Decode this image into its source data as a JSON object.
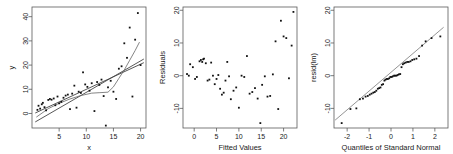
{
  "figure": {
    "panel_count": 3,
    "background": "#ffffff",
    "point_color": "#111111",
    "axis_color": "#5a5a5a"
  },
  "chart_data": [
    {
      "type": "scatter",
      "title": "",
      "xlabel": "x",
      "ylabel": "y",
      "xlim": [
        0,
        21
      ],
      "ylim": [
        -6,
        44
      ],
      "xticks": [
        5,
        10,
        15,
        20
      ],
      "yticks": [
        0,
        10,
        20,
        30,
        40
      ],
      "grid": false,
      "legend": "none",
      "x": [
        1.0,
        1.2,
        1.5,
        1.8,
        2.0,
        2.3,
        2.6,
        3.0,
        3.3,
        3.6,
        4.0,
        4.3,
        4.7,
        5.0,
        5.4,
        5.8,
        6.2,
        6.6,
        7.0,
        7.4,
        7.8,
        8.2,
        8.6,
        9.0,
        9.4,
        9.8,
        10.2,
        10.6,
        11.0,
        11.5,
        12.0,
        12.4,
        12.8,
        13.2,
        13.6,
        14.0,
        14.5,
        15.0,
        15.5,
        16.0,
        16.5,
        17.0,
        17.5,
        18.0,
        18.5,
        19.0,
        19.5,
        20.0
      ],
      "y": [
        1.5,
        3.2,
        2.0,
        3.8,
        4.4,
        2.6,
        1.3,
        5.6,
        6.0,
        5.7,
        6.2,
        3.4,
        7.0,
        4.2,
        4.8,
        6.5,
        7.4,
        7.8,
        1.8,
        8.2,
        11.5,
        2.4,
        9.0,
        8.5,
        17.0,
        12.0,
        11.0,
        9.4,
        12.5,
        1.0,
        13.0,
        11.8,
        14.0,
        7.2,
        -5.0,
        10.8,
        13.5,
        9.0,
        6.0,
        18.5,
        19.5,
        29.0,
        23.0,
        35.5,
        7.0,
        30.5,
        41.5,
        20.0
      ],
      "lines": [
        {
          "name": "least-squares-fit",
          "type": "straight",
          "x0": 0.6,
          "y0": 0.2,
          "x1": 20.6,
          "y1": 21.0
        },
        {
          "name": "robust-fit",
          "type": "straight",
          "x0": 0.6,
          "y0": -3.5,
          "x1": 20.6,
          "y1": 22.5
        },
        {
          "name": "lowess-smooth",
          "type": "curve",
          "points": [
            [
              0.8,
              -1.5
            ],
            [
              3,
              2.0
            ],
            [
              5,
              4.2
            ],
            [
              7,
              6.0
            ],
            [
              9,
              7.4
            ],
            [
              11,
              8.4
            ],
            [
              12.5,
              8.6
            ],
            [
              14,
              8.8
            ],
            [
              15,
              11.0
            ],
            [
              16,
              14.5
            ],
            [
              17,
              18.0
            ],
            [
              18,
              22.0
            ],
            [
              19,
              26.0
            ],
            [
              19.8,
              29.5
            ]
          ]
        }
      ]
    },
    {
      "type": "scatter",
      "title": "",
      "xlabel": "Fitted Values",
      "ylabel": "Residuals",
      "xlim": [
        -2.5,
        23
      ],
      "ylim": [
        -16,
        21
      ],
      "xticks": [
        0,
        5,
        10,
        15,
        20
      ],
      "yticks": [
        -10,
        0,
        10,
        20
      ],
      "grid": false,
      "legend": "none",
      "x": [
        -1.6,
        -1.2,
        -0.9,
        -0.3,
        0.2,
        0.6,
        1.2,
        1.5,
        1.8,
        2.0,
        2.2,
        2.6,
        3.0,
        3.4,
        3.8,
        4.2,
        4.6,
        5.0,
        5.4,
        5.8,
        6.2,
        6.6,
        7.0,
        7.4,
        7.8,
        8.2,
        8.8,
        9.4,
        10.0,
        10.6,
        11.2,
        11.8,
        12.4,
        13.0,
        13.6,
        14.2,
        14.8,
        15.2,
        15.8,
        16.4,
        17.0,
        17.6,
        18.2,
        18.8,
        19.4,
        20.0,
        20.6,
        21.2,
        21.8,
        22.2
      ],
      "y": [
        0.5,
        0.0,
        3.5,
        2.6,
        -1.0,
        -0.4,
        4.4,
        4.8,
        4.2,
        5.0,
        5.2,
        3.8,
        -1.5,
        -1.2,
        4.0,
        0.0,
        -2.6,
        -1.0,
        0.2,
        -4.0,
        -5.8,
        -5.2,
        -1.5,
        4.2,
        -0.2,
        -7.2,
        -4.6,
        -3.6,
        -9.8,
        0.0,
        -0.4,
        6.0,
        -5.5,
        -5.0,
        -3.8,
        -7.0,
        -14.5,
        -2.8,
        -0.2,
        -6.4,
        -6.2,
        0.4,
        10.5,
        -10.2,
        16.8,
        12.0,
        11.5,
        -0.8,
        9.2,
        19.5
      ]
    },
    {
      "type": "scatter",
      "title": "",
      "xlabel": "Quantiles of Standard Normal",
      "ylabel": "resid(lm)",
      "xlim": [
        -2.6,
        2.6
      ],
      "ylim": [
        -16,
        21
      ],
      "xticks": [
        -2,
        -1,
        0,
        1,
        2
      ],
      "yticks": [
        -10,
        0,
        10,
        20
      ],
      "grid": false,
      "legend": "none",
      "x": [
        -2.25,
        -1.85,
        -1.58,
        -1.42,
        -1.28,
        -1.16,
        -1.06,
        -0.97,
        -0.89,
        -0.81,
        -0.74,
        -0.67,
        -0.6,
        -0.54,
        -0.48,
        -0.42,
        -0.36,
        -0.3,
        -0.25,
        -0.19,
        -0.14,
        -0.08,
        -0.03,
        0.03,
        0.08,
        0.14,
        0.19,
        0.25,
        0.3,
        0.36,
        0.42,
        0.48,
        0.54,
        0.6,
        0.67,
        0.74,
        0.81,
        0.89,
        0.97,
        1.06,
        1.16,
        1.28,
        1.42,
        1.58,
        1.85,
        2.25
      ],
      "y": [
        -14.5,
        -10.2,
        -10.0,
        -7.2,
        -7.0,
        -6.4,
        -6.2,
        -5.8,
        -5.5,
        -5.2,
        -5.0,
        -4.6,
        -4.0,
        -3.8,
        -3.6,
        -2.8,
        -2.6,
        -1.5,
        -1.2,
        -1.0,
        -1.0,
        -0.8,
        -0.4,
        -0.4,
        -0.2,
        0.0,
        0.0,
        0.0,
        0.2,
        0.4,
        0.5,
        2.6,
        3.5,
        3.8,
        4.0,
        4.2,
        4.2,
        4.4,
        4.8,
        5.0,
        5.2,
        6.0,
        9.2,
        10.5,
        11.5,
        12.0,
        16.8,
        19.5
      ],
      "lines": [
        {
          "name": "qq-reference-line",
          "type": "straight",
          "x0": -2.55,
          "y0": -13.6,
          "x1": 2.4,
          "y1": 14.8
        }
      ]
    }
  ]
}
